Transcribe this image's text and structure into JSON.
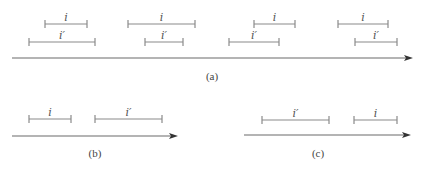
{
  "diagram": {
    "panels": [
      {
        "id": "a",
        "label": "(a)",
        "axis": {
          "x1": 12,
          "x2": 413,
          "y": 58
        },
        "label_pos": {
          "x": 212,
          "y": 80
        },
        "segments": [
          {
            "name": "i",
            "label": "i",
            "x1": 45,
            "x2": 87,
            "y": 24
          },
          {
            "name": "i-prime",
            "label": "i′",
            "x1": 29,
            "x2": 95,
            "y": 42
          },
          {
            "name": "i",
            "label": "i",
            "x1": 128,
            "x2": 195,
            "y": 24
          },
          {
            "name": "i-prime",
            "label": "i′",
            "x1": 145,
            "x2": 183,
            "y": 42
          },
          {
            "name": "i",
            "label": "i",
            "x1": 254,
            "x2": 295,
            "y": 24
          },
          {
            "name": "i-prime",
            "label": "i′",
            "x1": 229,
            "x2": 279,
            "y": 42
          },
          {
            "name": "i",
            "label": "i",
            "x1": 338,
            "x2": 388,
            "y": 24
          },
          {
            "name": "i-prime",
            "label": "i′",
            "x1": 355,
            "x2": 397,
            "y": 42
          }
        ]
      },
      {
        "id": "b",
        "label": "(b)",
        "axis": {
          "x1": 12,
          "x2": 178,
          "y": 136
        },
        "label_pos": {
          "x": 95,
          "y": 157
        },
        "segments": [
          {
            "name": "i",
            "label": "i",
            "x1": 29,
            "x2": 71,
            "y": 119
          },
          {
            "name": "i-prime",
            "label": "i′",
            "x1": 95,
            "x2": 162,
            "y": 119
          }
        ]
      },
      {
        "id": "c",
        "label": "(c)",
        "axis": {
          "x1": 244,
          "x2": 411,
          "y": 135
        },
        "label_pos": {
          "x": 318,
          "y": 157
        },
        "segments": [
          {
            "name": "i-prime",
            "label": "i′",
            "x1": 262,
            "x2": 329,
            "y": 120
          },
          {
            "name": "i",
            "label": "i",
            "x1": 354,
            "x2": 397,
            "y": 120
          }
        ]
      }
    ]
  }
}
